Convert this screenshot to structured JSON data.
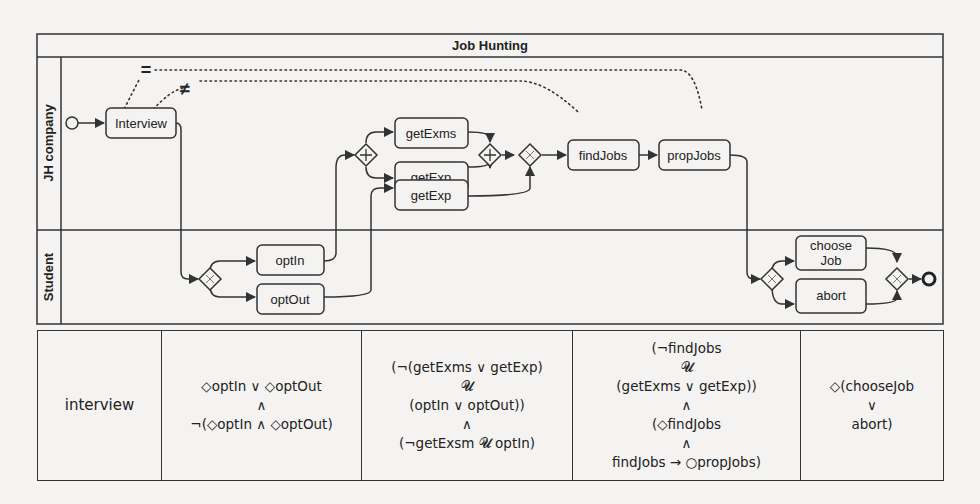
{
  "diagram": {
    "title": "Job Hunting",
    "lanes": [
      {
        "name": "JH company"
      },
      {
        "name": "Student"
      }
    ],
    "relations": {
      "equal": "=",
      "not_equal": "≠"
    },
    "tasks": {
      "interview": "Interview",
      "getExms": "getExms",
      "getExp_1": "getExp",
      "getExp_2": "getExp",
      "findJobs": "findJobs",
      "propJobs": "propJobs",
      "optIn": "optIn",
      "optOut": "optOut",
      "chooseJob_line1": "choose",
      "chooseJob_line2": "Job",
      "abort": "abort"
    },
    "gateways": {
      "parallel_symbol": "+",
      "exclusive_symbol": "×"
    },
    "colors": {
      "stroke": "#333333",
      "background": "#f4f3f1"
    }
  },
  "table": {
    "columns": [
      {
        "lines": [
          "interview"
        ]
      },
      {
        "lines": [
          "◇optIn ∨ ◇optOut",
          "∧",
          "¬(◇optIn ∧ ◇optOut)"
        ]
      },
      {
        "lines": [
          "(¬(getExms ∨ getExp)",
          "𝓤",
          "(optIn ∨ optOut))",
          "∧",
          "(¬getExsm 𝓤 optIn)"
        ]
      },
      {
        "lines": [
          "(¬findJobs",
          "𝓤",
          "(getExms ∨ getExp))",
          "∧",
          "(◇findJobs",
          "∧",
          "findJobs → ○propJobs)"
        ]
      },
      {
        "lines": [
          "◇(chooseJob",
          "∨",
          "abort)"
        ]
      }
    ]
  }
}
